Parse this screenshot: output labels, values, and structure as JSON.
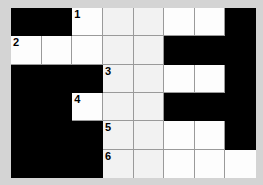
{
  "puzzle": {
    "title": "Crossword Grid",
    "columns": 8,
    "rows": 6,
    "background_color": "#d4d4d4",
    "block_color": "#000000",
    "cell_color": "#ffffff",
    "grid_line_color": "#9a9a9a",
    "number_color": "#000000",
    "clue_numbers_visible": [
      "1",
      "2",
      "3",
      "4",
      "5",
      "6"
    ],
    "cells": [
      {
        "r": 1,
        "c": 1,
        "type": "block",
        "number": ""
      },
      {
        "r": 1,
        "c": 2,
        "type": "block",
        "number": ""
      },
      {
        "r": 1,
        "c": 3,
        "type": "open",
        "number": "1",
        "value": ""
      },
      {
        "r": 1,
        "c": 4,
        "type": "open",
        "number": "",
        "value": ""
      },
      {
        "r": 1,
        "c": 5,
        "type": "open",
        "number": "",
        "value": ""
      },
      {
        "r": 1,
        "c": 6,
        "type": "open",
        "number": "",
        "value": ""
      },
      {
        "r": 1,
        "c": 7,
        "type": "open",
        "number": "",
        "value": ""
      },
      {
        "r": 1,
        "c": 8,
        "type": "block",
        "number": ""
      },
      {
        "r": 2,
        "c": 1,
        "type": "open",
        "number": "2",
        "value": ""
      },
      {
        "r": 2,
        "c": 2,
        "type": "open",
        "number": "",
        "value": ""
      },
      {
        "r": 2,
        "c": 3,
        "type": "open",
        "number": "",
        "value": ""
      },
      {
        "r": 2,
        "c": 4,
        "type": "open",
        "number": "",
        "value": ""
      },
      {
        "r": 2,
        "c": 5,
        "type": "open",
        "number": "",
        "value": ""
      },
      {
        "r": 2,
        "c": 6,
        "type": "block",
        "number": ""
      },
      {
        "r": 2,
        "c": 7,
        "type": "block",
        "number": ""
      },
      {
        "r": 2,
        "c": 8,
        "type": "block",
        "number": ""
      },
      {
        "r": 3,
        "c": 1,
        "type": "block",
        "number": ""
      },
      {
        "r": 3,
        "c": 2,
        "type": "block",
        "number": ""
      },
      {
        "r": 3,
        "c": 3,
        "type": "block",
        "number": ""
      },
      {
        "r": 3,
        "c": 4,
        "type": "open",
        "number": "3",
        "value": ""
      },
      {
        "r": 3,
        "c": 5,
        "type": "open",
        "number": "",
        "value": ""
      },
      {
        "r": 3,
        "c": 6,
        "type": "open",
        "number": "",
        "value": ""
      },
      {
        "r": 3,
        "c": 7,
        "type": "open",
        "number": "",
        "value": ""
      },
      {
        "r": 3,
        "c": 8,
        "type": "block",
        "number": ""
      },
      {
        "r": 4,
        "c": 1,
        "type": "block",
        "number": ""
      },
      {
        "r": 4,
        "c": 2,
        "type": "block",
        "number": ""
      },
      {
        "r": 4,
        "c": 3,
        "type": "open",
        "number": "4",
        "value": ""
      },
      {
        "r": 4,
        "c": 4,
        "type": "open",
        "number": "",
        "value": ""
      },
      {
        "r": 4,
        "c": 5,
        "type": "open",
        "number": "",
        "value": ""
      },
      {
        "r": 4,
        "c": 6,
        "type": "block",
        "number": ""
      },
      {
        "r": 4,
        "c": 7,
        "type": "block",
        "number": ""
      },
      {
        "r": 4,
        "c": 8,
        "type": "block",
        "number": ""
      },
      {
        "r": 5,
        "c": 1,
        "type": "block",
        "number": ""
      },
      {
        "r": 5,
        "c": 2,
        "type": "block",
        "number": ""
      },
      {
        "r": 5,
        "c": 3,
        "type": "block",
        "number": ""
      },
      {
        "r": 5,
        "c": 4,
        "type": "open",
        "number": "5",
        "value": ""
      },
      {
        "r": 5,
        "c": 5,
        "type": "open",
        "number": "",
        "value": ""
      },
      {
        "r": 5,
        "c": 6,
        "type": "open",
        "number": "",
        "value": ""
      },
      {
        "r": 5,
        "c": 7,
        "type": "open",
        "number": "",
        "value": ""
      },
      {
        "r": 5,
        "c": 8,
        "type": "block",
        "number": ""
      },
      {
        "r": 6,
        "c": 1,
        "type": "block",
        "number": ""
      },
      {
        "r": 6,
        "c": 2,
        "type": "block",
        "number": ""
      },
      {
        "r": 6,
        "c": 3,
        "type": "block",
        "number": ""
      },
      {
        "r": 6,
        "c": 4,
        "type": "open",
        "number": "6",
        "value": ""
      },
      {
        "r": 6,
        "c": 5,
        "type": "open",
        "number": "",
        "value": ""
      },
      {
        "r": 6,
        "c": 6,
        "type": "open",
        "number": "",
        "value": ""
      },
      {
        "r": 6,
        "c": 7,
        "type": "open",
        "number": "",
        "value": ""
      },
      {
        "r": 6,
        "c": 8,
        "type": "open",
        "number": "",
        "value": ""
      }
    ]
  }
}
